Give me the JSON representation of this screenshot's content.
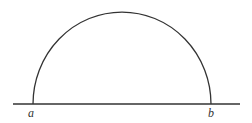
{
  "diagram": {
    "stroke_color": "#333333",
    "background": "#ffffff",
    "baseline": {
      "x1": 13,
      "x2": 240,
      "y": 104
    },
    "arc": {
      "start_x": 33,
      "end_x": 211,
      "base_y": 104,
      "top_y": 12
    },
    "labels": [
      {
        "text": "a",
        "x": 31,
        "y": 117
      },
      {
        "text": "b",
        "x": 211,
        "y": 117
      }
    ]
  }
}
